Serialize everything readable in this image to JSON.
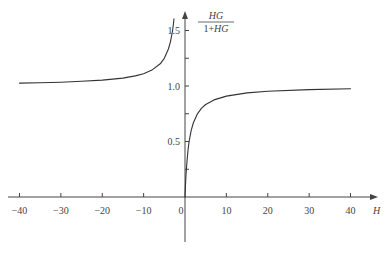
{
  "chart_data": {
    "type": "line",
    "title": "",
    "xlabel": "H",
    "ylabel": "HG/(1+HG)",
    "ylabel_num": "HG",
    "ylabel_den": "1+HG",
    "xlim": [
      -40,
      40
    ],
    "ylim": [
      0,
      1.6
    ],
    "grid": false,
    "x_ticks": [
      -40,
      -30,
      -20,
      -10,
      0,
      10,
      20,
      30,
      40
    ],
    "x_tick_labels": [
      "−40",
      "−30",
      "−20",
      "−10",
      "0",
      "10",
      "20",
      "30",
      "40"
    ],
    "y_ticks": [
      0.25,
      0.5,
      0.75,
      1.0,
      1.25,
      1.5
    ],
    "y_tick_labels": {
      "0.5": "0.5",
      "1.0": "1.0",
      "1.5": "1.5"
    },
    "series": [
      {
        "name": "negative-H branch",
        "x": [
          -40,
          -35,
          -30,
          -25,
          -20,
          -15,
          -12,
          -10,
          -8,
          -6,
          -5,
          -4,
          -3.5,
          -3,
          -2.8,
          -2.65
        ],
        "y": [
          1.026,
          1.029,
          1.034,
          1.042,
          1.053,
          1.071,
          1.091,
          1.111,
          1.143,
          1.2,
          1.25,
          1.333,
          1.4,
          1.5,
          1.556,
          1.606
        ]
      },
      {
        "name": "positive-H branch",
        "x": [
          0,
          0.1,
          0.25,
          0.5,
          0.75,
          1,
          1.5,
          2,
          3,
          4,
          5,
          7,
          10,
          15,
          20,
          30,
          40
        ],
        "y": [
          0,
          0.091,
          0.2,
          0.333,
          0.429,
          0.5,
          0.6,
          0.667,
          0.75,
          0.8,
          0.833,
          0.875,
          0.909,
          0.9375,
          0.952,
          0.968,
          0.976
        ]
      }
    ]
  }
}
